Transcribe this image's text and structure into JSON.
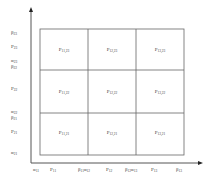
{
  "diagram": {
    "type": "partition-grid",
    "x_axis": {
      "labels": [
        {
          "base": "α",
          "sub": "11",
          "x": 33
        },
        {
          "base": "P",
          "sub": "11",
          "x": 52
        },
        {
          "base": "β",
          "sub": "11",
          "base2": "α",
          "sub2": "12",
          "x": 84
        },
        {
          "base": "P",
          "sub": "12",
          "x": 108
        },
        {
          "base": "β",
          "sub": "12",
          "base2": "α",
          "sub2": "13",
          "x": 130
        },
        {
          "base": "P",
          "sub": "13",
          "x": 154
        },
        {
          "base": "β",
          "sub": "13",
          "x": 178
        }
      ]
    },
    "y_axis": {
      "labels": [
        {
          "base": "β",
          "sub": "23",
          "y": 32
        },
        {
          "base": "P",
          "sub": "23",
          "y": 46
        },
        {
          "base": "α",
          "sub": "23",
          "y": 60
        },
        {
          "base": "β",
          "sub": "22",
          "y": 65
        },
        {
          "base": "P",
          "sub": "22",
          "y": 88
        },
        {
          "base": "α",
          "sub": "22",
          "y": 111
        },
        {
          "base": "β",
          "sub": "21",
          "y": 116
        },
        {
          "base": "P",
          "sub": "21",
          "y": 131
        },
        {
          "base": "α",
          "sub": "21",
          "y": 152
        }
      ]
    },
    "cells": [
      {
        "row": 0,
        "col": 0,
        "label": "P",
        "sub": "11,23"
      },
      {
        "row": 0,
        "col": 1,
        "label": "P",
        "sub": "12,23"
      },
      {
        "row": 0,
        "col": 2,
        "label": "P",
        "sub": "13,23"
      },
      {
        "row": 1,
        "col": 0,
        "label": "P",
        "sub": "11,22"
      },
      {
        "row": 1,
        "col": 1,
        "label": "P",
        "sub": "12,22"
      },
      {
        "row": 1,
        "col": 2,
        "label": "P",
        "sub": "13,22"
      },
      {
        "row": 2,
        "col": 0,
        "label": "P",
        "sub": "11,21"
      },
      {
        "row": 2,
        "col": 1,
        "label": "P",
        "sub": "12,21"
      },
      {
        "row": 2,
        "col": 2,
        "label": "P",
        "sub": "13,21"
      }
    ]
  }
}
